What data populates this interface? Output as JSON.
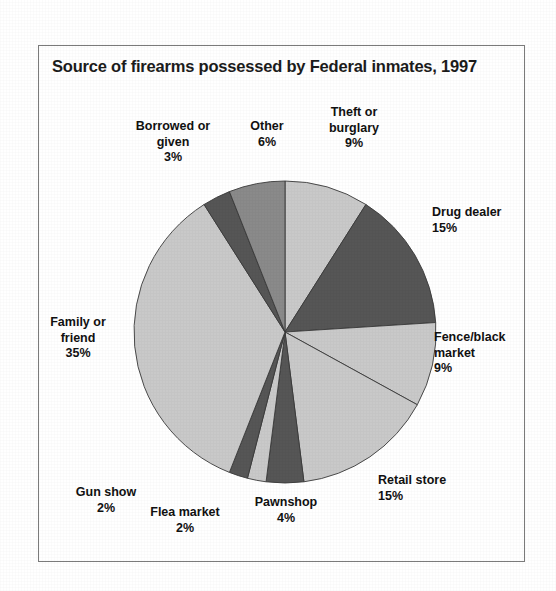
{
  "figure": {
    "title": "Source of firearms possessed by Federal inmates, 1997",
    "frame_border_color": "#7b7b7b",
    "background_color": "#ffffff"
  },
  "palette": {
    "light_gray": "#c9c9c9",
    "medium_gray": "#8a8a8a",
    "dark_gray": "#565656",
    "outline": "#3a3a3a",
    "text": "#111111"
  },
  "chart_data": {
    "type": "pie",
    "title": "Source of firearms possessed by Federal inmates, 1997",
    "xlabel": "",
    "ylabel": "",
    "units": "percent",
    "start_angle_deg": 0,
    "direction": "clockwise",
    "labels_show_percent": true,
    "legend": "none",
    "grid": false,
    "categories": [
      "Theft or burglary",
      "Drug dealer",
      "Fence/black market",
      "Retail store",
      "Pawnshop",
      "Flea market",
      "Gun show",
      "Family or friend",
      "Borrowed or given",
      "Other"
    ],
    "values": [
      9,
      15,
      9,
      15,
      4,
      2,
      2,
      35,
      3,
      6
    ],
    "colors": [
      "#c9c9c9",
      "#565656",
      "#c9c9c9",
      "#c9c9c9",
      "#565656",
      "#c9c9c9",
      "#565656",
      "#c9c9c9",
      "#565656",
      "#8a8a8a"
    ],
    "total": 100
  },
  "labels": {
    "theft_or_burglary": {
      "name": "Theft or",
      "name2": "burglary",
      "pct": "9%"
    },
    "drug_dealer": {
      "name": "Drug dealer",
      "pct": "15%"
    },
    "fence_black_market": {
      "name": "Fence/black",
      "name2": "market",
      "pct": "9%"
    },
    "retail_store": {
      "name": "Retail store",
      "pct": "15%"
    },
    "pawnshop": {
      "name": "Pawnshop",
      "pct": "4%"
    },
    "flea_market": {
      "name": "Flea market",
      "pct": "2%"
    },
    "gun_show": {
      "name": "Gun show",
      "pct": "2%"
    },
    "family_or_friend": {
      "name": "Family or",
      "name2": "friend",
      "pct": "35%"
    },
    "borrowed_or_given": {
      "name": "Borrowed or",
      "name2": "given",
      "pct": "3%"
    },
    "other": {
      "name": "Other",
      "pct": "6%"
    }
  }
}
